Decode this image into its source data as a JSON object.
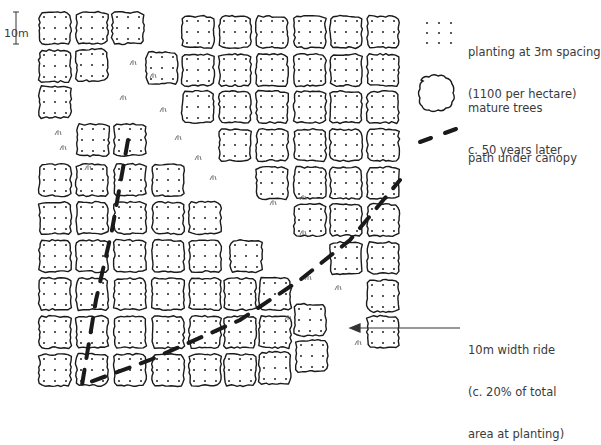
{
  "diagram": {
    "title": "",
    "scale": {
      "label": "10m"
    },
    "legend": [
      {
        "id": "planting",
        "icon": "dot-grid-icon",
        "line1": "planting at 3m spacing",
        "line2": "(1100 per hectare)"
      },
      {
        "id": "mature",
        "icon": "tree-canopy-icon",
        "line1": "mature trees",
        "line2": "c. 50 years later"
      },
      {
        "id": "path",
        "icon": "dashed-path-icon",
        "line1": "path under canopy",
        "line2": ""
      }
    ],
    "annotation": {
      "line1": "10m width ride",
      "line2": "(c. 20% of total",
      "line3": "area at planting)"
    },
    "colors": {
      "stroke": "#1a1a1a",
      "path": "#1a1a1a",
      "background": "#ffffff"
    }
  }
}
